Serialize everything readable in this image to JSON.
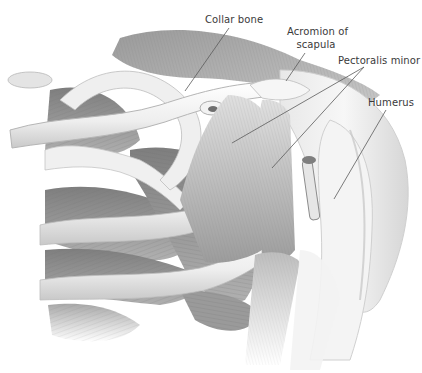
{
  "diagram": {
    "style": "grayscale pencil illustration",
    "colors": {
      "background": "#ffffff",
      "label_text": "#3a3a3a",
      "leader_line": "#5a5a5a",
      "muscle_dark": "#8c8c8c",
      "muscle_mid": "#b4b4b4",
      "bone_light": "#f2f2f2"
    },
    "labels": [
      {
        "id": "collar-bone",
        "text": "Collar bone",
        "x": 205,
        "y": 13,
        "pointer": {
          "x1": 229,
          "y1": 28,
          "x2": 185,
          "y2": 91
        }
      },
      {
        "id": "acromion",
        "line1": "Acromion of",
        "line2": "scapula",
        "x": 289,
        "y": 25,
        "pointer": {
          "x1": 305,
          "y1": 53,
          "x2": 286,
          "y2": 81
        }
      },
      {
        "id": "pectoralis-minor",
        "text": "Pectoralis minor",
        "x": 338,
        "y": 54,
        "pointers": [
          {
            "x1": 364,
            "y1": 67,
            "x2": 232,
            "y2": 143
          },
          {
            "x1": 364,
            "y1": 67,
            "x2": 272,
            "y2": 168
          }
        ]
      },
      {
        "id": "humerus",
        "text": "Humerus",
        "x": 368,
        "y": 96,
        "pointer": {
          "x1": 386,
          "y1": 110,
          "x2": 334,
          "y2": 199
        }
      }
    ]
  }
}
